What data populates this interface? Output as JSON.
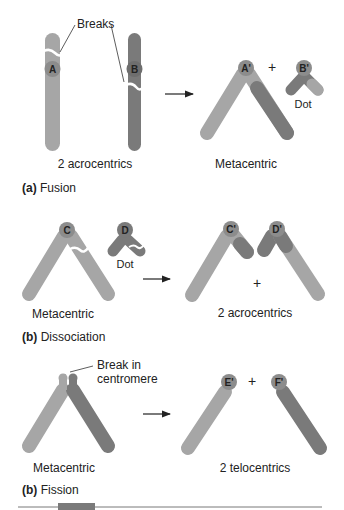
{
  "colors": {
    "light_chromosome": "#a6a6a6",
    "dark_chromosome": "#7a7a7a",
    "centromere": "#8c8c8c",
    "text": "#222222",
    "background": "#ffffff"
  },
  "panels": [
    {
      "id": "a",
      "label_letter": "(a)",
      "label_title": "Fusion",
      "left_caption": "2 acrocentrics",
      "right_caption": "Metacentric",
      "annotation": "Breaks",
      "centromeres_before": [
        "A",
        "B"
      ],
      "centromeres_after": [
        "A'",
        "B'"
      ],
      "plus": "+",
      "dot_label": "Dot"
    },
    {
      "id": "b",
      "label_letter": "(b)",
      "label_title": "Dissociation",
      "left_caption": "Metacentric",
      "right_caption": "2 acrocentrics",
      "centromeres_before": [
        "C",
        "D"
      ],
      "centromeres_after": [
        "C'",
        "D'"
      ],
      "plus": "+",
      "dot_label": "Dot"
    },
    {
      "id": "c",
      "label_letter": "(b)",
      "label_title": "Fission",
      "left_caption": "Metacentric",
      "right_caption": "2 telocentrics",
      "annotation_line1": "Break in",
      "annotation_line2": "centromere",
      "centromeres_after": [
        "E'",
        "F'"
      ],
      "plus": "+"
    }
  ]
}
